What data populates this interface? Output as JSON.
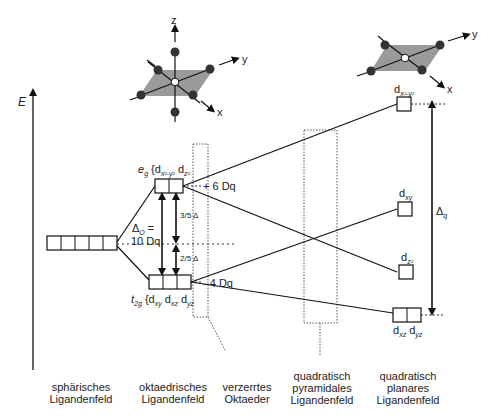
{
  "axis": {
    "energy_label": "E"
  },
  "octahedron": {
    "axes": [
      "z",
      "y",
      "x"
    ]
  },
  "square_planar_complex": {
    "axes": [
      "y",
      "x"
    ]
  },
  "spherical": {
    "boxes": 5
  },
  "octahedral": {
    "eg_label": "e",
    "eg_sub": "g",
    "eg_orbitals": "{d",
    "eg_orb1_sub": "x²-y²",
    "eg_orb2": " d",
    "eg_orb2_sub": "z²",
    "eg_energy": "+ 6 Dq",
    "t2g_label": "t",
    "t2g_sub": "2g",
    "t2g_orbitals": "{d",
    "t2g_orb1_sub": "xy",
    "t2g_orb2": " d",
    "t2g_orb2_sub": "xz",
    "t2g_orb3": " d",
    "t2g_orb3_sub": "yz",
    "t2g_energy": "- 4 Dq",
    "delta_o": "Δ",
    "delta_o_sub": "O",
    "delta_o_eq": " =",
    "delta_o_value": "10 Dq",
    "three_fifths": "3/5 Δ",
    "two_fifths": "2/5 Δ"
  },
  "square_planar": {
    "levels": [
      {
        "label": "d",
        "sub": "x²-y²"
      },
      {
        "label": "d",
        "sub": "xy"
      },
      {
        "label": "d",
        "sub": "z²"
      },
      {
        "label": "d",
        "sub": "xz",
        "label2": " d",
        "sub2": "yz"
      }
    ],
    "delta_q": "Δ",
    "delta_q_sub": "q"
  },
  "captions": [
    {
      "line1": "sphärisches",
      "line2": "Ligandenfeld"
    },
    {
      "line1": "oktaedrisches",
      "line2": "Ligandenfeld"
    },
    {
      "line1": "verzerrtes",
      "line2": "Oktaeder"
    },
    {
      "line1": "quadratisch",
      "line2": "pyramidales",
      "line3": "Ligandenfeld"
    },
    {
      "line1": "quadratisch",
      "line2": "planares",
      "line3": "Ligandenfeld"
    }
  ]
}
